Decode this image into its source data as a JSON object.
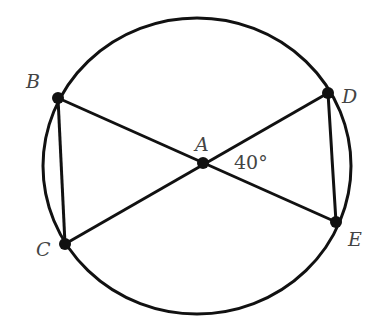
{
  "diagram": {
    "type": "circle-geometry",
    "circle": {
      "center_label": "A"
    },
    "points": [
      {
        "label": "A",
        "x": 203,
        "y": 163
      },
      {
        "label": "B",
        "x": 58,
        "y": 98
      },
      {
        "label": "C",
        "x": 65,
        "y": 244
      },
      {
        "label": "D",
        "x": 328,
        "y": 93
      },
      {
        "label": "E",
        "x": 336,
        "y": 222
      }
    ],
    "segments": [
      "BE",
      "CD",
      "BC",
      "DE"
    ],
    "angle": {
      "vertex": "A",
      "between": [
        "D",
        "E"
      ],
      "label": "40°"
    }
  },
  "labels": {
    "A": "A",
    "B": "B",
    "C": "C",
    "D": "D",
    "E": "E",
    "angle": "40°"
  }
}
